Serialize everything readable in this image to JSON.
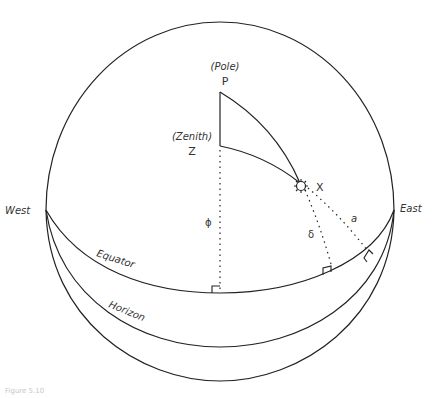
{
  "figure": {
    "caption": "Figure 5.10",
    "labels": {
      "pole_note": "(Pole)",
      "pole": "P",
      "zenith_note": "(Zenith)",
      "zenith": "Z",
      "star": "X",
      "west": "West",
      "east": "East",
      "equator": "Equator",
      "horizon": "Horizon",
      "latitude": "ϕ",
      "declination": "δ",
      "altitude": "a"
    },
    "colors": {
      "line": "#222222",
      "text": "#333333",
      "background": "#ffffff"
    }
  }
}
